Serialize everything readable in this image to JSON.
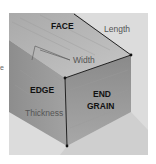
{
  "diagram": {
    "labels": {
      "face": "FACE",
      "length": "Length",
      "width": "Width",
      "edge": "EDGE",
      "end_grain_line1": "END",
      "end_grain_line2": "GRAIN",
      "thickness": "Thickness"
    },
    "left_fragment": "e",
    "colors": {
      "background": "#ffffff",
      "frame": "#dcdcdc",
      "face": "#b8b8b8",
      "edge": "#9a9a9a",
      "end_grain": "#8e8e8e",
      "shadow": "#cfcfcf",
      "line": "#111111"
    }
  }
}
